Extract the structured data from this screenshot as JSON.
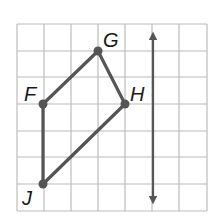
{
  "diagram": {
    "type": "geometry-grid",
    "grid": {
      "columns": 7,
      "rows": 7,
      "origin_px": [
        17,
        24
      ],
      "cell_px": 26.7,
      "line_color": "#bcbcbc"
    },
    "polygon": {
      "color": "#555555",
      "vertices": [
        {
          "name": "F",
          "col": 1,
          "row": 3
        },
        {
          "name": "G",
          "col": 3,
          "row": 1
        },
        {
          "name": "H",
          "col": 4,
          "row": 3
        },
        {
          "name": "J",
          "col": 1,
          "row": 6
        }
      ]
    },
    "reflection_line": {
      "type": "vertical-double-arrow",
      "col": 5,
      "color": "#555555"
    },
    "labels": {
      "F": "F",
      "G": "G",
      "H": "H",
      "J": "J"
    }
  }
}
